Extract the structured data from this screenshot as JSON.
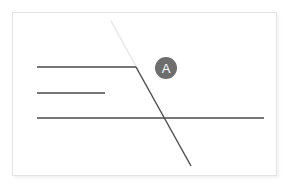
{
  "canvas": {
    "background_color": "#ffffff",
    "card": {
      "border_color": "#e3e3e3",
      "fill_color": "#ffffff",
      "x": 12,
      "y": 12,
      "width": 265,
      "height": 164
    }
  },
  "diagram": {
    "stroke_color": "#4a4a4a",
    "faint_stroke_color": "#eaeaea",
    "stroke_width": 1.4,
    "shapes": [
      {
        "name": "horizontal-line-top",
        "type": "line",
        "x1": 36,
        "y1": 66,
        "x2": 135,
        "y2": 66,
        "color": "#4a4a4a"
      },
      {
        "name": "horizontal-line-middle",
        "type": "line",
        "x1": 36,
        "y1": 92,
        "x2": 104,
        "y2": 92,
        "color": "#4a4a4a"
      },
      {
        "name": "horizontal-line-bottom",
        "type": "line",
        "x1": 36,
        "y1": 117,
        "x2": 263,
        "y2": 117,
        "color": "#4a4a4a"
      },
      {
        "name": "diagonal-line-descending",
        "type": "line",
        "x1": 135,
        "y1": 66,
        "x2": 190,
        "y2": 165,
        "color": "#4a4a4a"
      },
      {
        "name": "diagonal-line-faint-upper",
        "type": "line",
        "x1": 110,
        "y1": 20,
        "x2": 137,
        "y2": 69,
        "color": "#eaeaea"
      }
    ]
  },
  "badge": {
    "label": "A",
    "fill_color": "#6e6e6e",
    "text_color": "#ffffff",
    "x": 142,
    "y": 44,
    "diameter": 22
  }
}
